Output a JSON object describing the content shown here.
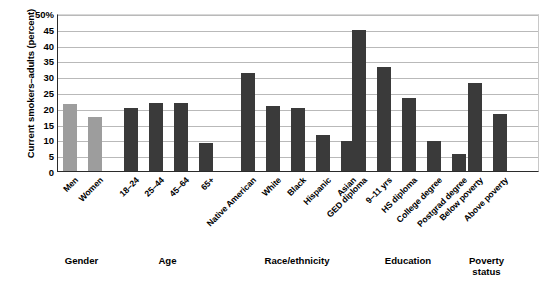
{
  "chart_data": {
    "type": "bar",
    "title": "",
    "xlabel": "",
    "ylabel": "Current smokers–adults (percent)",
    "ylim": [
      0,
      50
    ],
    "yticks": [
      "0",
      "5",
      "10",
      "15",
      "20",
      "25",
      "30",
      "35",
      "40",
      "45",
      "50%"
    ],
    "grid": true,
    "legend": "none",
    "colors": {
      "dark_bar": "#3a3a3a",
      "light_bar": "#9d9d9d",
      "gridline": "#b9b9b9",
      "axis": "#2b2b2b",
      "background": "#ffffff"
    },
    "groups": [
      {
        "name": "Gender",
        "categories": [
          "Men",
          "Women"
        ],
        "values": [
          21.3,
          17.0
        ],
        "shade": "light"
      },
      {
        "name": "Age",
        "categories": [
          "18–24",
          "25–44",
          "45–64",
          "65+"
        ],
        "values": [
          20.0,
          21.6,
          21.4,
          9.0
        ],
        "shade": "dark"
      },
      {
        "name": "Race/ethnicity",
        "categories": [
          "Native American",
          "White",
          "Black",
          "Hispanic",
          "Asian"
        ],
        "values": [
          31.0,
          20.6,
          20.0,
          11.5,
          9.5
        ],
        "shade": "dark"
      },
      {
        "name": "Education",
        "categories": [
          "GED diploma",
          "9–11 yrs",
          "HS diploma",
          "College degree",
          "Postgrad degree"
        ],
        "values": [
          44.5,
          33.0,
          23.0,
          9.5,
          5.5
        ],
        "shade": "dark"
      },
      {
        "name": "Poverty status",
        "categories": [
          "Below poverty",
          "Above poverty"
        ],
        "values": [
          28.0,
          18.0
        ],
        "shade": "dark"
      }
    ],
    "categories": [
      "Men",
      "Women",
      "18–24",
      "25–44",
      "45–64",
      "65+",
      "Native American",
      "White",
      "Black",
      "Hispanic",
      "Asian",
      "GED diploma",
      "9–11 yrs",
      "HS diploma",
      "College degree",
      "Postgrad degree",
      "Below poverty",
      "Above poverty"
    ],
    "values": [
      21.3,
      17.0,
      20.0,
      21.6,
      21.4,
      9.0,
      31.0,
      20.6,
      20.0,
      11.5,
      9.5,
      44.5,
      33.0,
      23.0,
      9.5,
      5.5,
      28.0,
      18.0
    ]
  },
  "group_labels": {
    "gender": "Gender",
    "age": "Age",
    "race": "Race/ethnicity",
    "education": "Education",
    "poverty_line1": "Poverty",
    "poverty_line2": "status"
  }
}
